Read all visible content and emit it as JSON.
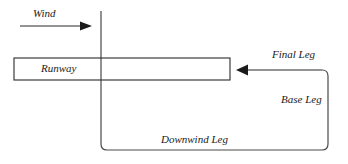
{
  "diagram": {
    "background_color": "#ffffff",
    "stroke_color": "#2b2b2b",
    "labels": {
      "wind": "Wind",
      "runway": "Runway",
      "final_leg": "Final Leg",
      "base_leg": "Base Leg",
      "downwind_leg": "Downwind Leg"
    },
    "icons": {
      "wind_arrow": "arrow-right-icon",
      "final_approach_arrow": "arrow-left-icon"
    }
  }
}
